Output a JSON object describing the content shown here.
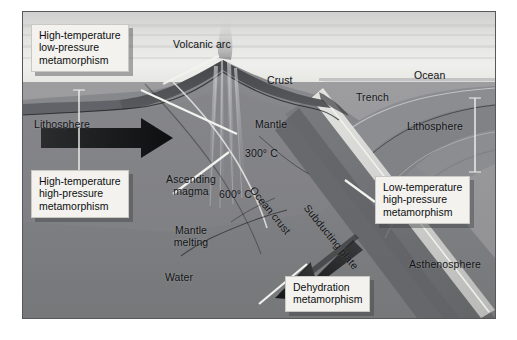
{
  "figure": {
    "type": "geology-cross-section",
    "background_color": "#ffffff",
    "frame_color": "#58585a"
  },
  "callouts": [
    {
      "id": "high-temp-low-pressure",
      "lines": [
        "High-temperature",
        "low-pressure",
        "metamorphism"
      ],
      "points_to": "volcanic-arc-root"
    },
    {
      "id": "high-temp-high-pressure",
      "lines": [
        "High-temperature",
        "high-pressure",
        "metamorphism"
      ],
      "points_to": "deep-slab-interface"
    },
    {
      "id": "low-temp-high-pressure",
      "lines": [
        "Low-temperature",
        "high-pressure",
        "metamorphism"
      ],
      "points_to": "shallow-slab-top"
    },
    {
      "id": "dehydration",
      "lines": [
        "Dehydration",
        "metamorphism"
      ],
      "points_to": "subducting-slab-base"
    }
  ],
  "labels": {
    "volcanic_arc": "Volcanic arc",
    "crust": "Crust",
    "ocean": "Ocean",
    "trench": "Trench",
    "mantle": "Mantle",
    "lithosphere_left": "Lithosphere",
    "lithosphere_right": "Lithosphere",
    "asthenosphere": "Asthenosphere",
    "ascending_magma_line1": "Ascending",
    "ascending_magma_line2": "magma",
    "mantle_melting_line1": "Mantle",
    "mantle_melting_line2": "melting",
    "water": "Water",
    "ocean_crust": "Ocean crust",
    "subducting_plate": "Subducting plate"
  },
  "isotherms": [
    {
      "id": "isotherm-300",
      "value": "300",
      "unit": "° C",
      "text": "300° C"
    },
    {
      "id": "isotherm-600",
      "value": "600",
      "unit": "° C",
      "text": "600° C"
    }
  ],
  "arrows": [
    {
      "id": "lithosphere-motion-arrow",
      "direction": "right",
      "color": "#18191b"
    },
    {
      "id": "subduction-arrow",
      "direction": "down-left",
      "color": "#1d1e20"
    }
  ],
  "palette": {
    "sky": "#e8e8e6",
    "ocean_water": "#d9d9d7",
    "crust": "#4a4b4d",
    "mantle_upper": "#86868a",
    "lithosphere": "#7b7c80",
    "asthenosphere": "#97979a",
    "slab": "#6d6e72",
    "callout_bg": "#f3f2ee",
    "text": "#111315"
  }
}
